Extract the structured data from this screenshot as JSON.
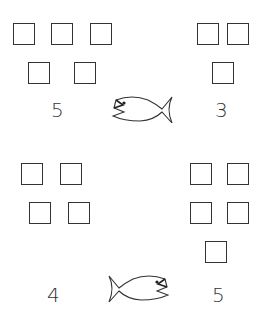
{
  "worksheet": {
    "problems": [
      {
        "id": "top",
        "left": {
          "count_label": "5",
          "squares": 5
        },
        "right": {
          "count_label": "3",
          "squares": 3
        },
        "fish_mouth_faces": "left"
      },
      {
        "id": "bottom",
        "left": {
          "count_label": "4",
          "squares": 4
        },
        "right": {
          "count_label": "5",
          "squares": 5
        },
        "fish_mouth_faces": "right"
      }
    ],
    "colors": {
      "ink": "#333333",
      "background": "#ffffff"
    }
  }
}
